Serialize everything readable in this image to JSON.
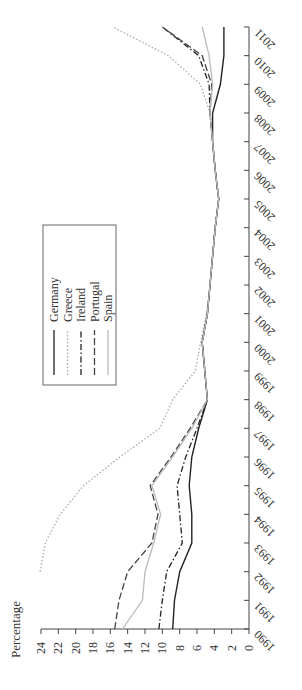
{
  "chart_data": {
    "type": "line",
    "orientation": "rotated-90-ccw",
    "title": "",
    "xlabel": "",
    "ylabel": "Percentage",
    "ylim": [
      0,
      24
    ],
    "yticks": [
      0,
      2,
      4,
      6,
      8,
      10,
      12,
      14,
      16,
      18,
      20,
      22,
      24
    ],
    "x": [
      1990,
      1991,
      1992,
      1993,
      1994,
      1995,
      1996,
      1997,
      1998,
      1999,
      2000,
      2001,
      2002,
      2003,
      2004,
      2005,
      2006,
      2007,
      2008,
      2009,
      2010,
      2011
    ],
    "xtick_labels": [
      "1990",
      "1991",
      "1992",
      "1993",
      "1994",
      "1995",
      "1996",
      "1997",
      "1998",
      "1999",
      "2000",
      "2001",
      "2002",
      "2003",
      "2004",
      "2005",
      "2006",
      "2007",
      "2008",
      "2009",
      "2010",
      "2011"
    ],
    "grid": false,
    "legend_position": "upper-left (inside plot)",
    "series": [
      {
        "name": "Germany",
        "style": "solid",
        "color": "#222222",
        "values": [
          8.8,
          8.6,
          8.0,
          6.6,
          6.6,
          6.9,
          6.6,
          5.8,
          4.8,
          5.1,
          5.4,
          4.8,
          4.5,
          4.2,
          3.9,
          3.5,
          3.9,
          4.2,
          4.2,
          3.3,
          2.9,
          2.9
        ]
      },
      {
        "name": "Greece",
        "style": "dotted",
        "color": "#aaaaaa",
        "values": [
          null,
          null,
          24.1,
          23.5,
          21.8,
          19.1,
          14.9,
          10.3,
          8.8,
          6.2,
          5.6,
          4.9,
          4.5,
          4.2,
          3.9,
          3.5,
          3.9,
          4.2,
          4.5,
          5.6,
          9.3,
          15.7
        ]
      },
      {
        "name": "Ireland",
        "style": "dash-dot",
        "color": "#222222",
        "values": [
          10.4,
          10.0,
          9.5,
          7.7,
          8.0,
          8.3,
          7.3,
          6.0,
          4.8,
          5.1,
          5.4,
          4.8,
          4.5,
          4.2,
          3.9,
          3.5,
          3.9,
          4.2,
          4.5,
          4.6,
          5.8,
          10.0
        ]
      },
      {
        "name": "Portugal",
        "style": "dashed",
        "color": "#444444",
        "values": [
          15.5,
          15.0,
          14.0,
          11.2,
          10.5,
          11.4,
          9.0,
          6.8,
          4.8,
          5.1,
          5.4,
          4.8,
          4.5,
          4.2,
          3.9,
          3.5,
          3.9,
          4.2,
          4.5,
          4.3,
          5.4,
          10.0
        ]
      },
      {
        "name": "Spain",
        "style": "solid",
        "color": "#bbbbbb",
        "values": [
          14.6,
          12.3,
          12.0,
          11.0,
          10.2,
          11.2,
          8.8,
          6.6,
          4.8,
          5.1,
          5.4,
          4.8,
          4.5,
          4.2,
          3.9,
          3.5,
          3.9,
          4.2,
          4.5,
          4.2,
          4.6,
          5.4
        ]
      }
    ]
  },
  "legend": {
    "items": [
      {
        "label": "Germany"
      },
      {
        "label": "Greece"
      },
      {
        "label": "Ireland"
      },
      {
        "label": "Portugal"
      },
      {
        "label": "Spain"
      }
    ]
  },
  "axis": {
    "value_title": "Percentage"
  }
}
